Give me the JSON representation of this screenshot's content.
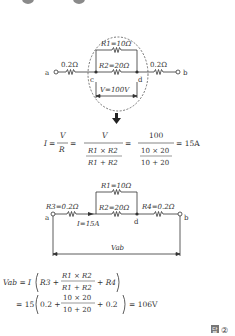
{
  "circuit1": {
    "left_res": "0.2Ω",
    "right_res": "0.2Ω",
    "r1": "R1=10Ω",
    "r2": "R2=20Ω",
    "node_a": "a",
    "node_b": "b",
    "node_c": "c",
    "node_d": "d",
    "voltage": "V=100V"
  },
  "formula1": {
    "lhs": "I",
    "v": "V",
    "r": "R",
    "num2": "V",
    "den2_top": "R1 × R2",
    "den2_bot": "R1 + R2",
    "num3": "100",
    "den3_top": "10 × 20",
    "den3_bot": "10 + 20",
    "result": "= 15A"
  },
  "circuit2": {
    "r1": "R1=10Ω",
    "r2": "R2=20Ω",
    "r3": "R3=0.2Ω",
    "r4": "R4=0.2Ω",
    "current": "I=15A",
    "node_a": "a",
    "node_b": "b",
    "node_d": "d",
    "vab": "Vab"
  },
  "formula2": {
    "line1_lhs": "Vab = I",
    "line1_terms": [
      "R3 +",
      "R1 × R2",
      "R1 + R2",
      "+ R4"
    ],
    "line2_prefix": "= 15",
    "line2_terms": [
      "0.2 +",
      "10 × 20",
      "10 + 20",
      "+ 0.2"
    ],
    "line2_result": "= 106V"
  },
  "answer": {
    "marker": "답",
    "choice": "②"
  }
}
